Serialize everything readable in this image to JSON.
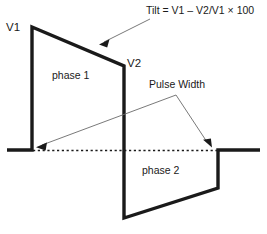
{
  "diagram": {
    "stroke_color": "#1a1a1a",
    "annotation_color": "#555555",
    "background_color": "#ffffff",
    "labels": {
      "v1": "V1",
      "v2": "V2",
      "phase1": "phase 1",
      "phase2": "phase 2",
      "pulse_width": "Pulse Width",
      "tilt_formula": "Tilt = V1 – V2/V1 × 100"
    },
    "icons": {
      "tilt_arrow": "arrow-pointing-down-left-icon",
      "pulse_width_left_arrow": "arrow-pointing-down-left-icon",
      "pulse_width_right_arrow": "arrow-pointing-down-right-icon",
      "baseline": "dotted-baseline-icon",
      "waveform": "biphasic-waveform-icon"
    },
    "geometry": {
      "baseline_y": 150,
      "waveform_points": "7,150 32,150 32,27 124,66 124,218 218,188 218,150 260,150",
      "phase1_left_x": 32,
      "phase1_right_x": 124,
      "phase2_right_x": 218,
      "v1_peak_y": 27,
      "v2_peak_y": 66,
      "phase2_trough_y": 218,
      "dotted_start_x": 32,
      "dotted_end_x": 218,
      "tilt_arrow_line": "148,20 100,44",
      "pw_apex": "176,95",
      "pw_left_tip": "36,147",
      "pw_right_tip": "212,146"
    }
  }
}
